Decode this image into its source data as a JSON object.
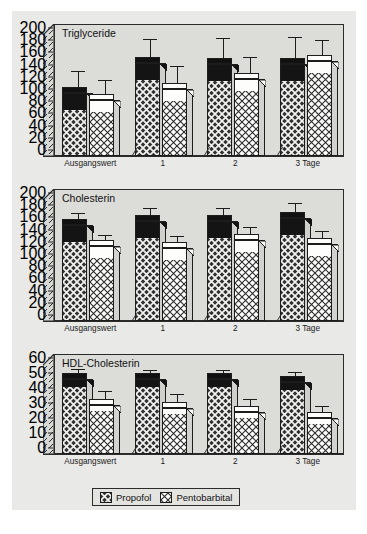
{
  "figure": {
    "background_color": "#e9e9e7",
    "plot_background_color": "#dcdcd9",
    "line_color": "#2b2b2b"
  },
  "legend": {
    "position": "bottom-center",
    "items": [
      {
        "label": "Propofol",
        "swatch": "dark-crosshatch",
        "color": "#2c2c2c"
      },
      {
        "label": "Pentobarbital",
        "swatch": "light-crosshatch",
        "color": "#fcfcfb"
      }
    ]
  },
  "chart_data": [
    {
      "type": "bar",
      "title": "Triglyceride",
      "xlabel": "",
      "ylabel": "",
      "ylim": [
        0,
        200
      ],
      "yticks": [
        0,
        20,
        40,
        60,
        80,
        100,
        120,
        140,
        160,
        180,
        200
      ],
      "grid": false,
      "categories": [
        "Ausgangswert",
        "1",
        "2",
        "3 Tage"
      ],
      "series": [
        {
          "name": "Propofol",
          "values": [
            103,
            152,
            151,
            151
          ],
          "errors": [
            27,
            30,
            32,
            34
          ]
        },
        {
          "name": "Pentobarbital",
          "values": [
            92,
            110,
            127,
            155
          ],
          "errors": [
            22,
            28,
            25,
            25
          ]
        }
      ]
    },
    {
      "type": "bar",
      "title": "Cholesterin",
      "xlabel": "",
      "ylabel": "",
      "ylim": [
        0,
        200
      ],
      "yticks": [
        0,
        20,
        40,
        60,
        80,
        100,
        120,
        140,
        160,
        180,
        200
      ],
      "grid": false,
      "categories": [
        "Ausgangswert",
        "1",
        "2",
        "3 Tage"
      ],
      "series": [
        {
          "name": "Propofol",
          "values": [
            157,
            164,
            164,
            169
          ],
          "errors": [
            10,
            12,
            12,
            15
          ]
        },
        {
          "name": "Pentobarbital",
          "values": [
            123,
            120,
            133,
            126
          ],
          "errors": [
            8,
            10,
            12,
            11
          ]
        }
      ]
    },
    {
      "type": "bar",
      "title": "HDL-Cholesterin",
      "xlabel": "",
      "ylabel": "",
      "ylim": [
        0,
        60
      ],
      "yticks": [
        0,
        10,
        20,
        30,
        40,
        50,
        60
      ],
      "grid": false,
      "categories": [
        "Ausgangswert",
        "1",
        "2",
        "3 Tage"
      ],
      "series": [
        {
          "name": "Propofol",
          "values": [
            50,
            50,
            50,
            48
          ],
          "errors": [
            3,
            2,
            2,
            3
          ]
        },
        {
          "name": "Pentobarbital",
          "values": [
            33,
            31,
            28,
            24
          ],
          "errors": [
            5,
            5,
            5,
            4
          ]
        }
      ]
    }
  ]
}
